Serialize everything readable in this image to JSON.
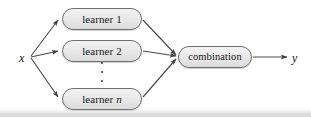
{
  "diagram": {
    "background_color": "#ffffff",
    "line_color": "#4a4a4a",
    "node_fill_color": "#e9e9e9",
    "node_border_color": "#6f6f6f",
    "text_color": "#1a1a1a",
    "input": {
      "label": "x",
      "name": "input-variable"
    },
    "output": {
      "label": "y",
      "name": "output-variable"
    },
    "ellipsis": {
      "label": "⋮",
      "dot_count": 3
    },
    "nodes": [
      {
        "id": "learner-1",
        "label": "learner 1",
        "text": "learner ",
        "sub": "1",
        "sub_italic": false
      },
      {
        "id": "learner-2",
        "label": "learner 2",
        "text": "learner ",
        "sub": "2",
        "sub_italic": false
      },
      {
        "id": "learner-n",
        "label": "learner n",
        "text": "learner ",
        "sub": "n",
        "sub_italic": true
      },
      {
        "id": "combination",
        "label": "combination",
        "text": "combination",
        "sub": "",
        "sub_italic": false
      }
    ],
    "edges": [
      {
        "from": "x",
        "to": "learner-1",
        "arrow": true
      },
      {
        "from": "x",
        "to": "learner-2",
        "arrow": true
      },
      {
        "from": "x",
        "to": "learner-n",
        "arrow": true
      },
      {
        "from": "learner-1",
        "to": "combination",
        "arrow": true
      },
      {
        "from": "learner-2",
        "to": "combination",
        "arrow": true
      },
      {
        "from": "learner-n",
        "to": "combination",
        "arrow": true
      },
      {
        "from": "combination",
        "to": "y",
        "arrow": true
      }
    ]
  }
}
